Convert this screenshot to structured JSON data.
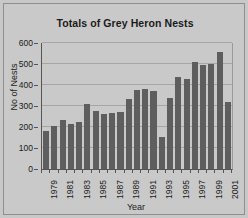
{
  "chart_data": {
    "type": "bar",
    "title": "Totals of Grey Heron Nests",
    "xlabel": "Year",
    "ylabel": "No of Nests",
    "ylim": [
      0,
      600
    ],
    "ytick_step": 100,
    "yticks": [
      0,
      100,
      200,
      300,
      400,
      500,
      600
    ],
    "ytick_labels": [
      "0",
      "100",
      "200",
      "300",
      "400",
      "500",
      "600"
    ],
    "grid": true,
    "grid_axis": "y",
    "legend": false,
    "bar_color": "#5e5e5e",
    "plot_background": "#c9c9c9",
    "categories": [
      "1979",
      "1980",
      "1981",
      "1982",
      "1983",
      "1984",
      "1985",
      "1986",
      "1987",
      "1988",
      "1989",
      "1990",
      "1991",
      "1992",
      "1993",
      "1994",
      "1995",
      "1996",
      "1997",
      "1998",
      "1999",
      "2000",
      "2001"
    ],
    "xtick_labels": [
      "1979",
      "1981",
      "1983",
      "1985",
      "1987",
      "1989",
      "1991",
      "1993",
      "1995",
      "1997",
      "1999",
      "2001"
    ],
    "values": [
      182,
      205,
      233,
      212,
      222,
      308,
      278,
      263,
      265,
      270,
      335,
      378,
      380,
      373,
      152,
      337,
      438,
      428,
      508,
      497,
      498,
      557,
      320
    ]
  }
}
